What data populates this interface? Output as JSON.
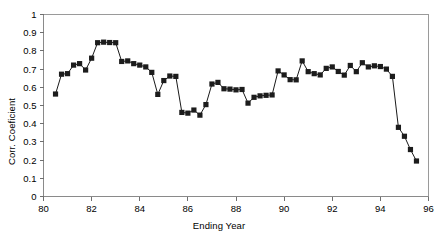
{
  "chart_data": {
    "type": "line",
    "title": "",
    "subtitle": "",
    "xlabel": "Ending Year",
    "ylabel": "Corr. Coeficient",
    "xlim": [
      80,
      96
    ],
    "ylim": [
      0,
      1
    ],
    "grid": false,
    "legend": null,
    "marker": "filled-square",
    "marker_color": "#1c1c1c",
    "line_color": "#1a1a1a",
    "xticks": [
      "80",
      "82",
      "84",
      "86",
      "88",
      "90",
      "92",
      "94",
      "96"
    ],
    "xtick_values": [
      80,
      82,
      84,
      86,
      88,
      90,
      92,
      94,
      96
    ],
    "yticks": [
      "0",
      "0.1",
      "0.2",
      "0.3",
      "0.4",
      "0.5",
      "0.6",
      "0.7",
      "0.8",
      "0.9",
      "1"
    ],
    "ytick_values": [
      0,
      0.1,
      0.2,
      0.3,
      0.4,
      0.5,
      0.6,
      0.7,
      0.8,
      0.9,
      1
    ],
    "series": [
      {
        "name": "Corr. Coeficient",
        "x": [
          80.5,
          80.75,
          81.0,
          81.25,
          81.5,
          81.75,
          82.0,
          82.25,
          82.5,
          82.75,
          83.0,
          83.25,
          83.5,
          83.75,
          84.0,
          84.25,
          84.5,
          84.75,
          85.0,
          85.25,
          85.5,
          85.75,
          86.0,
          86.25,
          86.5,
          86.75,
          87.0,
          87.25,
          87.5,
          87.75,
          88.0,
          88.25,
          88.5,
          88.75,
          89.0,
          89.25,
          89.5,
          89.75,
          90.0,
          90.25,
          90.5,
          90.75,
          91.0,
          91.25,
          91.5,
          91.75,
          92.0,
          92.25,
          92.5,
          92.75,
          93.0,
          93.25,
          93.5,
          93.75,
          94.0,
          94.25,
          94.5,
          94.75,
          95.0,
          95.25,
          95.5
        ],
        "values": [
          0.563,
          0.672,
          0.675,
          0.722,
          0.73,
          0.695,
          0.76,
          0.845,
          0.848,
          0.846,
          0.845,
          0.742,
          0.745,
          0.73,
          0.722,
          0.712,
          0.682,
          0.561,
          0.637,
          0.662,
          0.66,
          0.462,
          0.458,
          0.475,
          0.447,
          0.505,
          0.618,
          0.627,
          0.592,
          0.59,
          0.586,
          0.588,
          0.513,
          0.545,
          0.553,
          0.556,
          0.558,
          0.69,
          0.668,
          0.642,
          0.641,
          0.745,
          0.686,
          0.675,
          0.668,
          0.704,
          0.712,
          0.687,
          0.667,
          0.72,
          0.686,
          0.735,
          0.712,
          0.718,
          0.714,
          0.7,
          0.66,
          0.38,
          0.331,
          0.258,
          0.195
        ]
      }
    ],
    "annotations": []
  },
  "axis": {
    "x_title": "Ending Year",
    "y_title": "Corr. Coeficient"
  }
}
